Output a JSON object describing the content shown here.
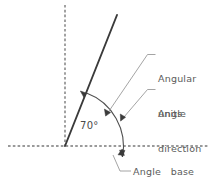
{
  "diagram": {
    "background_color": "#ffffff",
    "line_color": "#3a3a3a",
    "dashed_color": "#7a7a7a",
    "leader_color": "#8a8a8a",
    "text_color": "#5b5b5b",
    "labels": {
      "angular_units_line1": "Angular",
      "angular_units_line2": "units",
      "angle_direction_line1": "Angle",
      "angle_direction_line2": "direction",
      "angle_base": "Angle   base",
      "angle_value": "70°"
    },
    "geometry": {
      "vertex_x": 65,
      "vertex_y": 146,
      "ray_end_x": 117,
      "ray_end_y": 15,
      "angle_degrees": 70,
      "base_axis_from_x": 8,
      "base_axis_to_x": 208,
      "base_axis_y": 146,
      "vertical_axis_x": 65,
      "vertical_axis_from_y": 5,
      "vertical_axis_to_y": 146,
      "arc_radius": 57
    },
    "icons": {
      "arc_arrow_upper": "arrowhead-icon",
      "arc_arrow_lower": "arrowhead-icon",
      "base_arrow": "arrowhead-icon"
    }
  }
}
